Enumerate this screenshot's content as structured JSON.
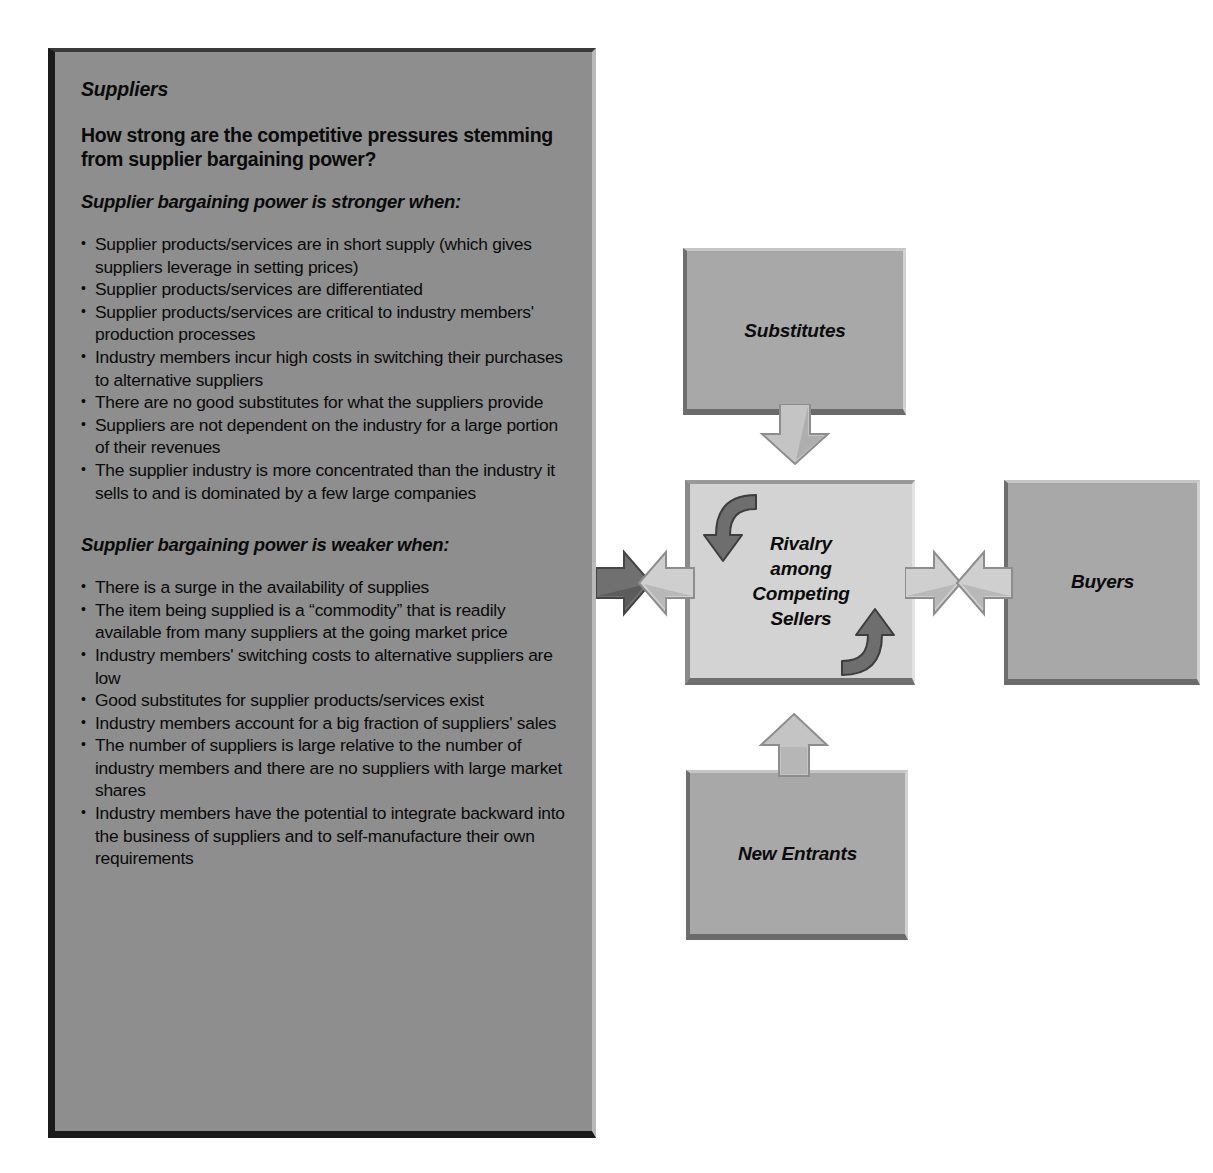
{
  "panel": {
    "title": "Suppliers",
    "question": "How strong are the competitive pressures stemming from supplier bargaining power?",
    "stronger_heading": "Supplier bargaining power is stronger when:",
    "stronger_items": [
      "Supplier products/services are in short supply (which gives suppliers leverage in setting prices)",
      "Supplier products/services are differentiated",
      "Supplier products/services are critical to industry members' production processes",
      "Industry members incur high costs in switching their purchases to alternative suppliers",
      "There are no good substitutes for what the suppliers provide",
      "Suppliers are not dependent on the industry for a large portion of their revenues",
      "The supplier industry is more concentrated than the industry it sells to and is dominated by a few large companies"
    ],
    "weaker_heading": "Supplier bargaining power is weaker when:",
    "weaker_items": [
      "There is a surge in the availability of supplies",
      "The item being supplied is a “commodity” that is readily available from many suppliers at the going market price",
      "Industry members' switching costs to alternative suppliers are low",
      "Good substitutes for supplier products/services exist",
      "Industry members account for a big fraction of suppliers' sales",
      "The number of suppliers is large relative to the number of industry members and there are no suppliers with large market shares",
      "Industry members have the potential to integrate backward into the business of suppliers and to self-manufacture their own requirements"
    ]
  },
  "diagram": {
    "substitutes": "Substitutes",
    "rivalry": "Rivalry among Competing Sellers",
    "buyers": "Buyers",
    "new_entrants": "New Entrants"
  },
  "colors": {
    "panel_fill": "#8e8e8e",
    "box_fill": "#a8a8a8",
    "center_fill": "#d3d3d3",
    "arrow_light": "#c9c9c9",
    "arrow_dark": "#6a6a6a",
    "text": "#0a0a0a"
  }
}
